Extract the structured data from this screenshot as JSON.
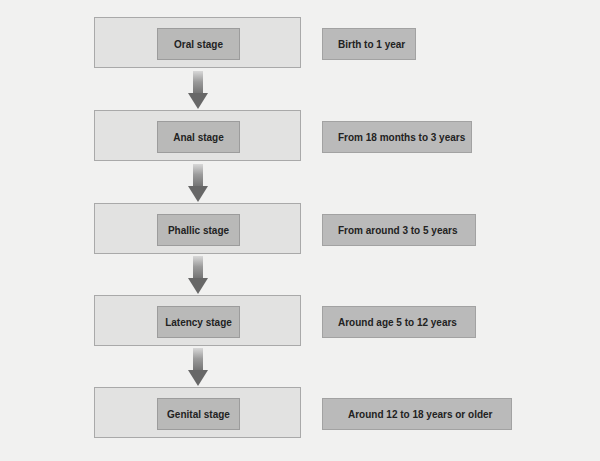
{
  "diagram": {
    "title": "",
    "stages": [
      {
        "label": "Oral stage",
        "age": "Birth to 1 year"
      },
      {
        "label": "Anal stage",
        "age": "From 18 months to 3 years"
      },
      {
        "label": "Phallic stage",
        "age": "From around 3 to 5 years"
      },
      {
        "label": "Latency stage",
        "age": "Around age 5 to 12 years"
      },
      {
        "label": "Genital stage",
        "age": "Around 12 to 18 years or older"
      }
    ],
    "connector": "down-arrow-icon",
    "colors": {
      "background": "#f1f1f0",
      "outer_box": "#e2e2e1",
      "inner_box": "#b9b9b8",
      "age_box": "#bababa",
      "arrow": "#676767"
    }
  }
}
